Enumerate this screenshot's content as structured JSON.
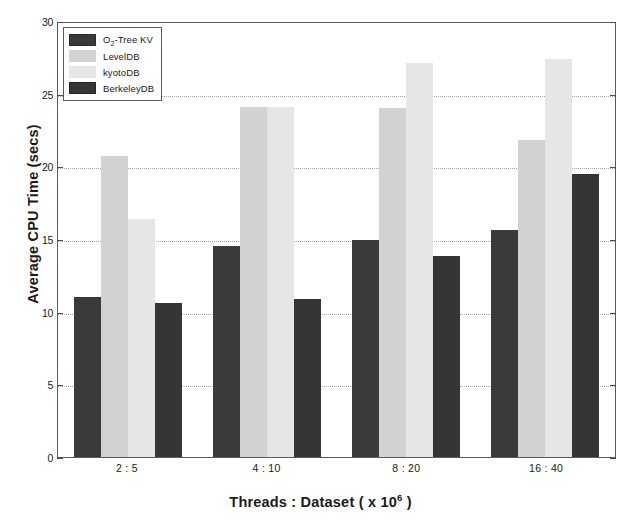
{
  "chart_data": {
    "type": "bar",
    "title": "",
    "xlabel": "Threads : Dataset ( x 10^6 )",
    "ylabel": "Average CPU Time (secs)",
    "categories": [
      "2 : 5",
      "4 : 10",
      "8 : 20",
      "16 : 40"
    ],
    "series": [
      {
        "name": "O2-Tree KV",
        "values": [
          11.0,
          14.5,
          14.9,
          15.6
        ],
        "color": "#3a3a3a"
      },
      {
        "name": "LevelDB",
        "values": [
          20.7,
          24.1,
          24.0,
          21.8
        ],
        "color": "#d2d2d2"
      },
      {
        "name": "kyotoDB",
        "values": [
          16.4,
          24.1,
          27.1,
          27.4
        ],
        "color": "#e6e6e6"
      },
      {
        "name": "BerkeleyDB",
        "values": [
          10.6,
          10.9,
          13.8,
          19.5
        ],
        "color": "#353535"
      }
    ],
    "ylim": [
      0,
      30
    ],
    "yticks": [
      0,
      5,
      10,
      15,
      20,
      25,
      30
    ],
    "grid": true,
    "legend_position": "top-left"
  },
  "axes": {
    "y_title": "Average CPU Time (secs)",
    "x_title_main": "Threads : Dataset ( x 10",
    "x_title_exponent": "6",
    "x_title_tail": " )",
    "y_tick_labels": [
      "30",
      "25",
      "20",
      "15",
      "10",
      "5",
      "0"
    ],
    "x_tick_labels": [
      "2 : 5",
      "4 : 10",
      "8 : 20",
      "16 : 40"
    ]
  },
  "legend": {
    "items": [
      {
        "label_pre": "O",
        "label_sub": "2",
        "label_post": "-Tree KV",
        "swatch": "s0"
      },
      {
        "label_pre": "LevelDB",
        "label_sub": "",
        "label_post": "",
        "swatch": "s1"
      },
      {
        "label_pre": "kyotoDB",
        "label_sub": "",
        "label_post": "",
        "swatch": "s2"
      },
      {
        "label_pre": "BerkeleyDB",
        "label_sub": "",
        "label_post": "",
        "swatch": "s3"
      }
    ]
  }
}
